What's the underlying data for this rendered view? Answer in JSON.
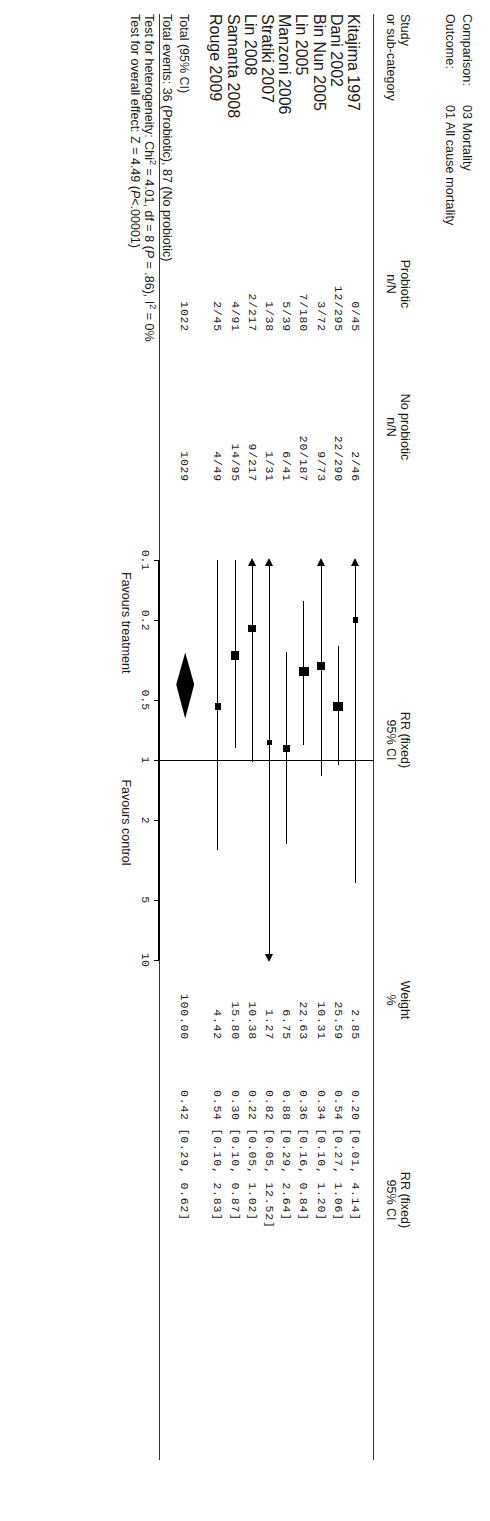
{
  "header": {
    "comparison_label": "Comparison:",
    "comparison_value": "03 Mortality",
    "outcome_label": "Outcome:",
    "outcome_value": "01 All cause mortality"
  },
  "columns": {
    "study_l1": "Study",
    "study_l2": "or sub-category",
    "probiotic_l1": "Probiotic",
    "probiotic_l2": "n/N",
    "noprobiotic_l1": "No probiotic",
    "noprobiotic_l2": "n/N",
    "plot_l1": "RR (fixed)",
    "plot_l2": "95% CI",
    "weight_l1": "Weight",
    "weight_l2": "%",
    "rr_l1": "RR (fixed)",
    "rr_l2": "95% CI"
  },
  "rows": [
    {
      "study": "Kitajima 1997",
      "probiotic": "0/45",
      "noprobiotic": "2/46",
      "weight": "2.85",
      "rr": "0.20 [0.01, 4.14]"
    },
    {
      "study": "Dani 2002",
      "probiotic": "12/295",
      "noprobiotic": "22/290",
      "weight": "25.59",
      "rr": "0.54 [0.27, 1.06]"
    },
    {
      "study": "Bin Nun 2005",
      "probiotic": "3/72",
      "noprobiotic": "9/73",
      "weight": "10.31",
      "rr": "0.34 [0.10, 1.20]"
    },
    {
      "study": "Lin 2005",
      "probiotic": "7/180",
      "noprobiotic": "20/187",
      "weight": "22.63",
      "rr": "0.36 [0.16, 0.84]"
    },
    {
      "study": "Manzoni 2006",
      "probiotic": "5/39",
      "noprobiotic": "6/41",
      "weight": "6.75",
      "rr": "0.88 [0.29, 2.64]"
    },
    {
      "study": "Stratiki 2007",
      "probiotic": "1/38",
      "noprobiotic": "1/31",
      "weight": "1.27",
      "rr": "0.82 [0.05, 12.52]"
    },
    {
      "study": "Lin 2008",
      "probiotic": "2/217",
      "noprobiotic": "9/217",
      "weight": "10.38",
      "rr": "0.22 [0.05, 1.02]"
    },
    {
      "study": "Samanta 2008",
      "probiotic": "4/91",
      "noprobiotic": "14/95",
      "weight": "15.80",
      "rr": "0.30 [0.10, 0.87]"
    },
    {
      "study": "Rouge 2009",
      "probiotic": "2/45",
      "noprobiotic": "4/49",
      "weight": "4.42",
      "rr": "0.54 [0.10, 2.83]"
    }
  ],
  "total": {
    "label": "Total (95% CI)",
    "probiotic": "1022",
    "noprobiotic": "1029",
    "weight": "100.00",
    "rr": "0.42 [0.29, 0.62]"
  },
  "notes": {
    "events": "Total events: 36 (Probiotic), 87 (No probiotic)",
    "heterogeneity_pre": "Test for heterogeneity: Chi",
    "heterogeneity_sup": "2",
    "heterogeneity_mid": " = 4.01, df = 8 (",
    "heterogeneity_p": "P",
    "heterogeneity_post": " = .86), I",
    "heterogeneity_sup2": "2",
    "heterogeneity_end": " = 0%",
    "overall_pre": "Test for overall effect: Z = 4.49 (",
    "overall_p": "P",
    "overall_post": "<.00001)"
  },
  "axis": {
    "ticks": [
      "0.1",
      "0.2",
      "0.5",
      "1",
      "2",
      "5",
      "10"
    ],
    "favours_left": "Favours treatment",
    "favours_right": "Favours control"
  },
  "chart_data": {
    "type": "forest",
    "xlabel": "RR (fixed) 95% CI",
    "xscale": "log",
    "xlim": [
      0.1,
      10
    ],
    "xticks": [
      0.1,
      0.2,
      0.5,
      1,
      2,
      5,
      10
    ],
    "reference_line": 1,
    "studies": [
      {
        "name": "Kitajima 1997",
        "rr": 0.2,
        "lo": 0.01,
        "hi": 4.14,
        "weight": 2.85,
        "events_t": 0,
        "n_t": 45,
        "events_c": 2,
        "n_c": 46,
        "lo_clipped": true
      },
      {
        "name": "Dani 2002",
        "rr": 0.54,
        "lo": 0.27,
        "hi": 1.06,
        "weight": 25.59,
        "events_t": 12,
        "n_t": 295,
        "events_c": 22,
        "n_c": 290
      },
      {
        "name": "Bin Nun 2005",
        "rr": 0.34,
        "lo": 0.1,
        "hi": 1.2,
        "weight": 10.31,
        "events_t": 3,
        "n_t": 72,
        "events_c": 9,
        "n_c": 73,
        "lo_clipped": true
      },
      {
        "name": "Lin 2005",
        "rr": 0.36,
        "lo": 0.16,
        "hi": 0.84,
        "weight": 22.63,
        "events_t": 7,
        "n_t": 180,
        "events_c": 20,
        "n_c": 187
      },
      {
        "name": "Manzoni 2006",
        "rr": 0.88,
        "lo": 0.29,
        "hi": 2.64,
        "weight": 6.75,
        "events_t": 5,
        "n_t": 39,
        "events_c": 6,
        "n_c": 41
      },
      {
        "name": "Stratiki 2007",
        "rr": 0.82,
        "lo": 0.05,
        "hi": 12.52,
        "weight": 1.27,
        "events_t": 1,
        "n_t": 38,
        "events_c": 1,
        "n_c": 31,
        "lo_clipped": true,
        "hi_clipped": true
      },
      {
        "name": "Lin 2008",
        "rr": 0.22,
        "lo": 0.05,
        "hi": 1.02,
        "weight": 10.38,
        "events_t": 2,
        "n_t": 217,
        "events_c": 9,
        "n_c": 217,
        "lo_clipped": true
      },
      {
        "name": "Samanta 2008",
        "rr": 0.3,
        "lo": 0.1,
        "hi": 0.87,
        "weight": 15.8,
        "events_t": 4,
        "n_t": 91,
        "events_c": 14,
        "n_c": 95
      },
      {
        "name": "Rouge 2009",
        "rr": 0.54,
        "lo": 0.1,
        "hi": 2.83,
        "weight": 4.42,
        "events_t": 2,
        "n_t": 45,
        "events_c": 4,
        "n_c": 49
      }
    ],
    "pooled": {
      "name": "Total (95% CI)",
      "rr": 0.42,
      "lo": 0.29,
      "hi": 0.62,
      "weight": 100.0,
      "n_t": 1022,
      "n_c": 1029
    }
  }
}
